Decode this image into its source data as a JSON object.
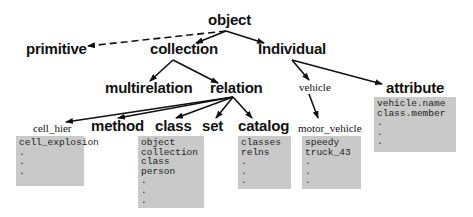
{
  "diagram": {
    "nodes": {
      "object": "object",
      "primitive": "primitive",
      "collection": "collection",
      "individual": "Individual",
      "multirelation": "multirelation",
      "relation": "relation",
      "vehicle": "vehicle",
      "attribute": "attribute",
      "cell_hier": "cell_hier",
      "method": "method",
      "class": "class",
      "set": "set",
      "catalog": "catalog",
      "motor_vehicle": "motor_vehicle"
    },
    "boxes": {
      "cell_hier": [
        "cell_explosion",
        ".",
        ".",
        "."
      ],
      "class": [
        "object",
        "collection",
        "class",
        "person",
        ".",
        ".",
        "."
      ],
      "catalog": [
        "classes",
        "relns",
        ".",
        ".",
        "."
      ],
      "motor_vehicle": [
        "speedy",
        "truck_43",
        ".",
        ".",
        "."
      ],
      "attribute": [
        "vehicle.name",
        "class.member",
        ".",
        ".",
        "."
      ]
    },
    "edges": [
      {
        "from": "object",
        "to": "primitive",
        "style": "dashed"
      },
      {
        "from": "object",
        "to": "collection",
        "style": "solid"
      },
      {
        "from": "object",
        "to": "individual",
        "style": "solid"
      },
      {
        "from": "collection",
        "to": "multirelation",
        "style": "solid"
      },
      {
        "from": "collection",
        "to": "relation",
        "style": "solid"
      },
      {
        "from": "relation",
        "to": "cell_hier",
        "style": "solid"
      },
      {
        "from": "relation",
        "to": "method",
        "style": "solid"
      },
      {
        "from": "relation",
        "to": "class",
        "style": "solid"
      },
      {
        "from": "relation",
        "to": "set",
        "style": "solid"
      },
      {
        "from": "relation",
        "to": "catalog",
        "style": "solid"
      },
      {
        "from": "individual",
        "to": "vehicle",
        "style": "solid"
      },
      {
        "from": "individual",
        "to": "attribute",
        "style": "solid"
      },
      {
        "from": "vehicle",
        "to": "motor_vehicle",
        "style": "solid"
      }
    ]
  }
}
